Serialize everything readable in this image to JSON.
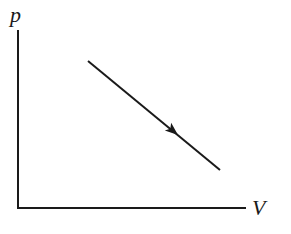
{
  "diagram": {
    "type": "pV diagram",
    "y_axis_label": "p",
    "x_axis_label": "V",
    "process": {
      "description": "straight line process, pressure decreasing as volume increases",
      "direction": "arrow points from upper-left to lower-right"
    },
    "colors": {
      "stroke": "#1a1a1a",
      "background": "#ffffff"
    }
  }
}
